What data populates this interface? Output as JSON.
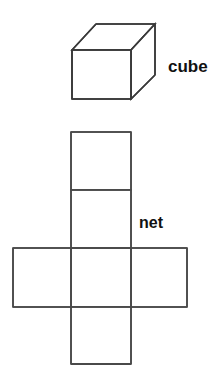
{
  "figure": {
    "title_cube": "cube",
    "title_net": "net",
    "stroke_color": "#3a3a3a",
    "stroke_color_light": "#4a4a4a",
    "background_color": "#ffffff",
    "stroke_width": 1.6,
    "canvas": {
      "width": 219,
      "height": 384
    }
  },
  "cube": {
    "label": "cube",
    "label_x": 168,
    "label_y": 57,
    "front_face": {
      "top_left_x": 72,
      "top_left_y": 50,
      "top_right_x": 131,
      "top_right_y": 50,
      "bottom_right_x": 131,
      "bottom_right_y": 99,
      "bottom_left_x": 72,
      "bottom_left_y": 99
    },
    "back_face": {
      "top_left_x": 96,
      "top_left_y": 24,
      "top_right_x": 155,
      "top_right_y": 24,
      "bottom_right_x": 155,
      "bottom_right_y": 75
    },
    "faces_visible": 3,
    "face_names": [
      "front",
      "top",
      "right"
    ]
  },
  "net": {
    "label": "net",
    "label_x": 139,
    "label_y": 214,
    "arrangement": "cross",
    "square_count": 6,
    "column_left_x": 71,
    "column_right_x": 131,
    "row_left_x": 13,
    "row_right_x": 187,
    "squares": [
      {
        "name": "column-square-1",
        "x": 71,
        "y": 132,
        "w": 60,
        "h": 58
      },
      {
        "name": "column-square-2",
        "x": 71,
        "y": 190,
        "w": 60,
        "h": 58
      },
      {
        "name": "column-square-3",
        "x": 71,
        "y": 248,
        "w": 60,
        "h": 59
      },
      {
        "name": "column-square-4",
        "x": 71,
        "y": 307,
        "w": 60,
        "h": 57
      },
      {
        "name": "row-square-left",
        "x": 13,
        "y": 248,
        "w": 58,
        "h": 59
      },
      {
        "name": "row-square-right",
        "x": 131,
        "y": 248,
        "w": 56,
        "h": 59
      }
    ]
  }
}
